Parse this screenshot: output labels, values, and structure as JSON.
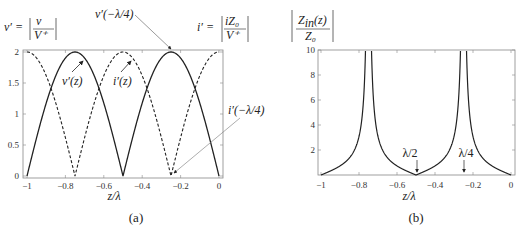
{
  "chart_data": [
    {
      "id": "a",
      "type": "line",
      "caption": "(a)",
      "xlabel": "z/λ",
      "ylabel_left": "v' = |v / V+|",
      "ylabel_right": "i' = |iZ0 / V+|",
      "xlim": [
        -1,
        0
      ],
      "ylim": [
        0,
        2
      ],
      "xticks": [
        "−1",
        "−0.8",
        "−0.6",
        "−0.4",
        "−0.2",
        "0"
      ],
      "yticks": [
        "0",
        "0.5",
        "1",
        "1.5",
        "2"
      ],
      "grid": false,
      "series": [
        {
          "name": "v'(z)",
          "style": "solid",
          "formula": "2|sin(2πz/λ)|",
          "x": [
            -1,
            -0.875,
            -0.75,
            -0.625,
            -0.5,
            -0.375,
            -0.25,
            -0.125,
            0
          ],
          "values": [
            0,
            1.414,
            2,
            1.414,
            0,
            1.414,
            2,
            1.414,
            0
          ]
        },
        {
          "name": "i'(z)",
          "style": "dashed",
          "formula": "2|cos(2πz/λ)|",
          "x": [
            -1,
            -0.875,
            -0.75,
            -0.625,
            -0.5,
            -0.375,
            -0.25,
            -0.125,
            0
          ],
          "values": [
            2,
            1.414,
            0,
            1.414,
            2,
            1.414,
            0,
            1.414,
            2
          ]
        }
      ],
      "annotations": [
        "v'(z)",
        "i'(z)",
        "v'(−λ/4)",
        "i'(−λ/4)"
      ]
    },
    {
      "id": "b",
      "type": "line",
      "caption": "(b)",
      "xlabel": "z/λ",
      "ylabel": "|Zin(z) / Z0|",
      "xlim": [
        -1,
        0
      ],
      "ylim": [
        0,
        10
      ],
      "xticks": [
        "−1",
        "−0.8",
        "−0.6",
        "−0.4",
        "−0.2",
        "0"
      ],
      "yticks": [
        "2",
        "4",
        "6",
        "8",
        "10"
      ],
      "grid": false,
      "series": [
        {
          "name": "|Zin/Z0|",
          "style": "solid",
          "formula": "|tan(2πz/λ)|",
          "x": [
            -1,
            -0.9,
            -0.8,
            -0.75,
            -0.7,
            -0.6,
            -0.5,
            -0.4,
            -0.3,
            -0.25,
            -0.2,
            -0.1,
            0
          ],
          "values": [
            0,
            0.727,
            3.078,
            "inf",
            3.078,
            0.727,
            0,
            0.727,
            3.078,
            "inf",
            3.078,
            0.727,
            0
          ]
        }
      ],
      "annotations": [
        "λ/2",
        "λ/4"
      ]
    }
  ],
  "labels": {
    "a_vprime_lhs": "v′ =",
    "a_v_num": "v",
    "a_v_den": "V⁺",
    "a_iprime_lhs": "i′ =",
    "a_i_num": "iZ₀",
    "a_i_den": "V⁺",
    "a_ann_vz": "v′(z)",
    "a_ann_iz": "i′(z)",
    "a_ann_vq": "v′(−λ/4)",
    "a_ann_iq": "i′(−λ/4)",
    "a_xlabel": "z/λ",
    "a_caption": "(a)",
    "b_num": "Z",
    "b_num_sub": "in",
    "b_num_arg": "(z)",
    "b_den": "Z₀",
    "b_ann_half": "λ/2",
    "b_ann_quarter": "λ/4",
    "b_xlabel": "z/λ",
    "b_caption": "(b)",
    "xticks": [
      "−1",
      "−0.8",
      "−0.6",
      "−0.4",
      "−0.2",
      "0"
    ],
    "a_yticks": [
      "0",
      "0.5",
      "1",
      "1.5",
      "2"
    ],
    "b_yticks": [
      "2",
      "4",
      "6",
      "8",
      "10"
    ]
  }
}
